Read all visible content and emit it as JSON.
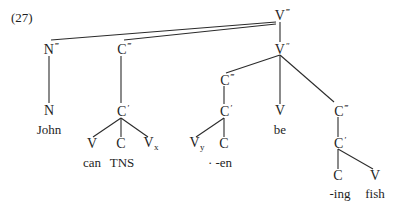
{
  "example_number": "(27)",
  "tree": {
    "root": {
      "cat": "V",
      "bar": "‴"
    },
    "v_double_bar": {
      "cat": "V",
      "bar": "″"
    },
    "subject_np": {
      "cat": "N",
      "bar": "‴"
    },
    "subject_n": {
      "cat": "N",
      "bar": ""
    },
    "subject_word": "John",
    "modal_cp": {
      "cat": "C",
      "bar": "‴"
    },
    "modal_cbar": {
      "cat": "C",
      "bar": "′"
    },
    "modal_v": {
      "cat": "V",
      "bar": ""
    },
    "modal_v_word": "can",
    "modal_c": {
      "cat": "C",
      "bar": ""
    },
    "modal_c_word": "TNS",
    "modal_vx": {
      "cat": "V",
      "sub": "x"
    },
    "perf_cp": {
      "cat": "C",
      "bar": "‴"
    },
    "perf_cbar": {
      "cat": "C",
      "bar": "′"
    },
    "perf_vy": {
      "cat": "V",
      "sub": "y"
    },
    "perf_c": {
      "cat": "C",
      "bar": ""
    },
    "perf_c_word": "· -en",
    "main_v": {
      "cat": "V",
      "bar": ""
    },
    "main_v_word": "be",
    "prog_cp": {
      "cat": "C",
      "bar": "‴"
    },
    "prog_cbar": {
      "cat": "C",
      "bar": "′"
    },
    "prog_c": {
      "cat": "C",
      "bar": ""
    },
    "prog_c_word": "-ing",
    "prog_v": {
      "cat": "V",
      "bar": ""
    },
    "prog_v_word": "fish"
  }
}
